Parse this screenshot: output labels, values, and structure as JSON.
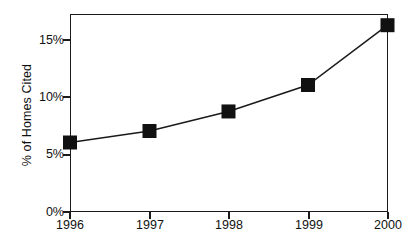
{
  "chart_data": {
    "type": "line",
    "title": "",
    "xlabel": "",
    "ylabel": "% of Homes Cited",
    "categories": [
      "1996",
      "1997",
      "1998",
      "1999",
      "2000"
    ],
    "values": [
      6.0,
      7.0,
      8.7,
      11.0,
      16.2
    ],
    "series": [
      {
        "name": "% of Homes Cited",
        "values": [
          6.0,
          7.0,
          8.7,
          11.0,
          16.2
        ]
      }
    ],
    "ylim": [
      0,
      17.4
    ],
    "ytick_values": [
      0,
      5,
      10,
      15
    ],
    "ytick_labels": [
      "0%",
      "5%",
      "10%",
      "15%"
    ],
    "xtick_labels": [
      "1996",
      "1997",
      "1998",
      "1999",
      "2000"
    ],
    "grid": false,
    "legend": false,
    "marker": "square",
    "marker_color": "#111111",
    "line_color": "#1a1a1a",
    "frame_color": "#1a1a1a",
    "background": "#ffffff"
  },
  "axes": {
    "y_title": "% of Homes Cited",
    "y_ticks": [
      "15%",
      "10%",
      "5%",
      "0%"
    ],
    "x_ticks": [
      "1996",
      "1997",
      "1998",
      "1999",
      "2000"
    ]
  }
}
